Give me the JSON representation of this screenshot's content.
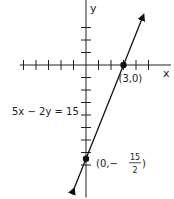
{
  "chart_data": {
    "type": "line",
    "title": "",
    "xlabel": "x",
    "ylabel": "y",
    "xlim": [
      -5.3,
      6.8
    ],
    "ylim": [
      -10.6,
      5.2
    ],
    "x_ticks": [
      -5,
      -4,
      -3,
      -2,
      -1,
      1,
      2,
      3,
      4,
      5
    ],
    "y_ticks": [
      -8,
      -7,
      -6,
      -5,
      -4,
      -3,
      -2,
      -1,
      1,
      2,
      3
    ],
    "grid": false,
    "series": [
      {
        "name": "5x - 2y = 15",
        "equation": "5x - 2y = 15",
        "slope": 2.5,
        "intercept": -7.5,
        "x_range": [
          -0.96,
          4.6
        ],
        "arrows": "both"
      }
    ],
    "points": [
      {
        "x": 3,
        "y": 0,
        "label": "(3,0)"
      },
      {
        "x": 0,
        "y": -7.5,
        "label_prefix": "(0,−",
        "label_num": "15",
        "label_den": "2",
        "label_suffix": ")"
      }
    ],
    "annotations": [
      {
        "text": "5x − 2y = 15"
      }
    ]
  }
}
